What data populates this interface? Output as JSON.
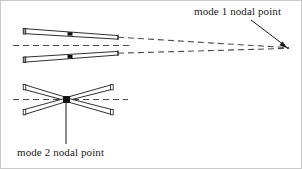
{
  "figure": {
    "type": "technical-diagram",
    "background_color": "#ffffff",
    "border_color": "#c8c8c8",
    "line_color": "#1a1a1a",
    "dash_color": "#555555",
    "marker_color": "#111111",
    "width": 302,
    "height": 169
  },
  "labels": {
    "mode1": "mode 1 nodal point",
    "mode2": "mode 2 nodal point"
  },
  "annotations": [
    {
      "name": "mode-1-leader",
      "from_x": 252,
      "from_y": 20,
      "to_x": 286,
      "to_y": 46,
      "arrow": true
    },
    {
      "name": "mode-2-leader",
      "from_x": 66,
      "from_y": 101,
      "to_x": 66,
      "to_y": 144,
      "arrow": false
    }
  ],
  "nodal_points": {
    "mode1": {
      "x": 288,
      "y": 48
    },
    "mode2": {
      "x": 66,
      "y": 99
    }
  },
  "mode1_assembly": {
    "centerline": {
      "x1": 13,
      "y1": 45,
      "x2": 130,
      "y2": 45
    },
    "blades": [
      {
        "name": "mode-1-upper-blade",
        "root_x": 24,
        "root_y": 31,
        "tip_x": 118,
        "tip_y": 37,
        "thickness": 4.5,
        "marker_x": 70,
        "marker_y": 34
      },
      {
        "name": "mode-1-lower-blade",
        "root_x": 24,
        "root_y": 59,
        "tip_x": 118,
        "tip_y": 53,
        "thickness": 4.5,
        "marker_x": 70,
        "marker_y": 56
      }
    ],
    "extension_lines": [
      {
        "name": "upper-extension",
        "x1": 118,
        "y1": 37,
        "x2": 288,
        "y2": 48
      },
      {
        "name": "lower-extension",
        "x1": 118,
        "y1": 53,
        "x2": 288,
        "y2": 48
      }
    ]
  },
  "mode2_assembly": {
    "centerline": {
      "x1": 13,
      "y1": 99,
      "x2": 128,
      "y2": 99
    },
    "blades": [
      {
        "name": "mode-2-blade-upper-left",
        "root_x": 24,
        "root_y": 86,
        "tip_x": 66,
        "tip_y": 99,
        "thickness": 4.5
      },
      {
        "name": "mode-2-blade-lower-left",
        "root_x": 24,
        "root_y": 113,
        "tip_x": 66,
        "tip_y": 99,
        "thickness": 4.5
      },
      {
        "name": "mode-2-blade-upper-right",
        "root_x": 112,
        "root_y": 86,
        "tip_x": 66,
        "tip_y": 99,
        "thickness": 4.5
      },
      {
        "name": "mode-2-blade-lower-right",
        "root_x": 112,
        "root_y": 113,
        "tip_x": 66,
        "tip_y": 99,
        "thickness": 4.5
      }
    ],
    "marker": {
      "x": 66,
      "y": 99,
      "w": 7,
      "h": 7
    }
  }
}
